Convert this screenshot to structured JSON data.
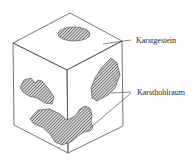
{
  "diagram": {
    "type": "block-diagram",
    "labels": {
      "rock": "Karstgestein",
      "cavity": "Karsthohlraum"
    },
    "colors": {
      "line": "#555555",
      "hatch_dark": "#444444",
      "hatch_light": "#d8d8d8",
      "background": "#ffffff",
      "text": "#222222"
    }
  }
}
